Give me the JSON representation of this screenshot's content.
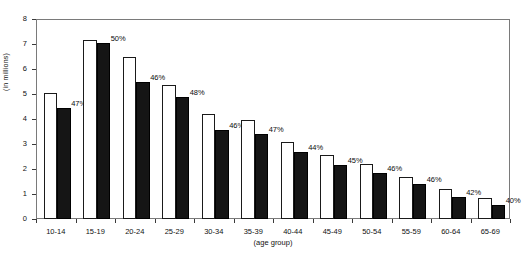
{
  "chart_data": {
    "type": "bar",
    "title": "",
    "subtitle": "",
    "xlabel": "(age group)",
    "ylabel": "(in millions)",
    "ylim": [
      0,
      8
    ],
    "yticks": [
      0,
      1,
      2,
      3,
      4,
      5,
      6,
      7,
      8
    ],
    "grid": false,
    "legend": null,
    "categories": [
      "10-14",
      "15-19",
      "20-24",
      "25-29",
      "30-34",
      "35-39",
      "40-44",
      "45-49",
      "50-54",
      "55-59",
      "60-64",
      "65-69"
    ],
    "series": [
      {
        "name": "total",
        "style": "white-outlined",
        "values": [
          5.05,
          7.15,
          6.5,
          5.35,
          4.2,
          3.95,
          3.1,
          2.55,
          2.2,
          1.7,
          1.2,
          0.85
        ]
      },
      {
        "name": "subgroup",
        "style": "black-filled",
        "values": [
          4.45,
          7.05,
          5.5,
          4.9,
          3.55,
          3.4,
          2.7,
          2.15,
          1.85,
          1.4,
          0.9,
          0.55
        ]
      }
    ],
    "annotations": [
      "47%",
      "50%",
      "46%",
      "48%",
      "46%",
      "47%",
      "44%",
      "45%",
      "46%",
      "46%",
      "42%",
      "40%"
    ]
  }
}
